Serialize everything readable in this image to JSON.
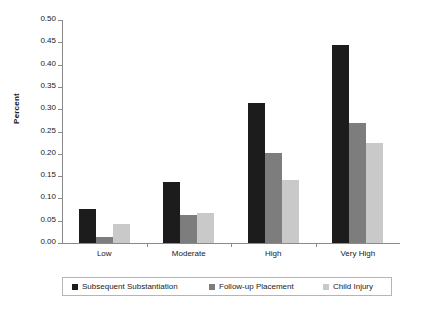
{
  "chart_data": {
    "type": "bar",
    "title": "",
    "xlabel": "",
    "ylabel": "Percent",
    "categories": [
      "Low",
      "Moderate",
      "High",
      "Very High"
    ],
    "series": [
      {
        "name": "Subsequent Substantiation",
        "color": "#1c1c1c",
        "values": [
          0.077,
          0.137,
          0.313,
          0.444
        ]
      },
      {
        "name": "Follow-up Placement",
        "color": "#7d7d7d",
        "values": [
          0.014,
          0.062,
          0.202,
          0.27
        ]
      },
      {
        "name": "Child Injury",
        "color": "#c9c9c9",
        "values": [
          0.043,
          0.068,
          0.142,
          0.225
        ]
      }
    ],
    "ylim": [
      0.0,
      0.5
    ],
    "ytick_labels": [
      "0.00",
      "0.05",
      "0.10",
      "0.15",
      "0.20",
      "0.25",
      "0.30",
      "0.35",
      "0.40",
      "0.45",
      "0.50"
    ],
    "ytick_values": [
      0.0,
      0.05,
      0.1,
      0.15,
      0.2,
      0.25,
      0.3,
      0.35,
      0.4,
      0.45,
      0.5
    ],
    "grid": false,
    "legend_position": "bottom"
  }
}
